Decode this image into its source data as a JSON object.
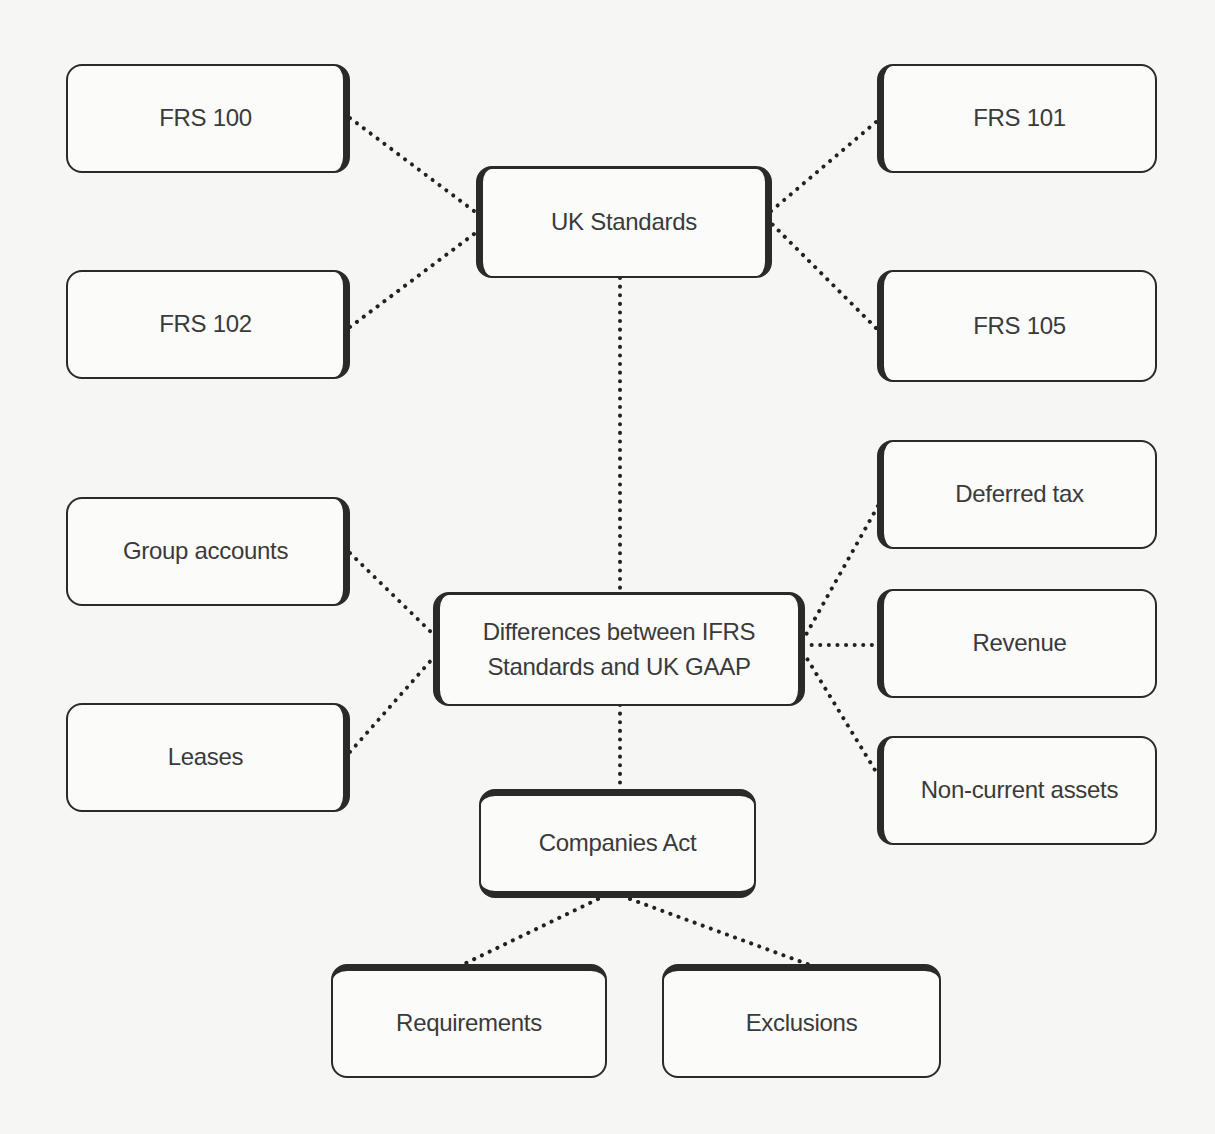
{
  "diagram": {
    "type": "mind-map",
    "center_node": {
      "id": "differences",
      "label": "Differences between IFRS\nStandards and UK GAAP"
    },
    "nodes": {
      "uk_standards": {
        "label": "UK Standards"
      },
      "frs100": {
        "label": "FRS 100"
      },
      "frs101": {
        "label": "FRS 101"
      },
      "frs102": {
        "label": "FRS 102"
      },
      "frs105": {
        "label": "FRS 105"
      },
      "group_accounts": {
        "label": "Group accounts"
      },
      "leases": {
        "label": "Leases"
      },
      "deferred_tax": {
        "label": "Deferred tax"
      },
      "revenue": {
        "label": "Revenue"
      },
      "non_current_assets": {
        "label": "Non-current assets"
      },
      "companies_act": {
        "label": "Companies Act"
      },
      "requirements": {
        "label": "Requirements"
      },
      "exclusions": {
        "label": "Exclusions"
      }
    },
    "edges": [
      {
        "from": "uk_standards",
        "to": "frs100",
        "style": "dotted"
      },
      {
        "from": "uk_standards",
        "to": "frs101",
        "style": "dotted"
      },
      {
        "from": "uk_standards",
        "to": "frs102",
        "style": "dotted"
      },
      {
        "from": "uk_standards",
        "to": "frs105",
        "style": "dotted"
      },
      {
        "from": "uk_standards",
        "to": "differences",
        "style": "dotted"
      },
      {
        "from": "differences",
        "to": "group_accounts",
        "style": "dotted"
      },
      {
        "from": "differences",
        "to": "leases",
        "style": "dotted"
      },
      {
        "from": "differences",
        "to": "deferred_tax",
        "style": "dotted"
      },
      {
        "from": "differences",
        "to": "revenue",
        "style": "dotted"
      },
      {
        "from": "differences",
        "to": "non_current_assets",
        "style": "dotted"
      },
      {
        "from": "differences",
        "to": "companies_act",
        "style": "dotted"
      },
      {
        "from": "companies_act",
        "to": "requirements",
        "style": "dotted"
      },
      {
        "from": "companies_act",
        "to": "exclusions",
        "style": "dotted"
      }
    ],
    "colors": {
      "background": "#f6f6f5",
      "box_fill": "#fbfbfa",
      "border": "#2a2a2a",
      "text": "#3a3a3a",
      "connector": "#222222"
    }
  }
}
